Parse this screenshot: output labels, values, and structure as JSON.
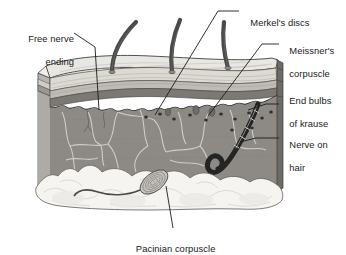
{
  "figure": {
    "type": "anatomical-cross-section-diagram",
    "style": "grayscale line illustration of a three-dimensional block of skin"
  },
  "labels": [
    {
      "id": "free-nerve-ending",
      "text_line1": "Free nerve",
      "text_line2": "ending",
      "align": "right",
      "x": 8,
      "y": 22
    },
    {
      "id": "merkels-discs",
      "text_line1": "Merkel's discs",
      "text_line2": "",
      "align": "left",
      "x": 242,
      "y": 6
    },
    {
      "id": "meissners-corpuscle",
      "text_line1": "Meissner's",
      "text_line2": "corpuscle",
      "align": "left",
      "x": 282,
      "y": 34
    },
    {
      "id": "end-bulbs-of-krause",
      "text_line1": "End bulbs",
      "text_line2": "of krause",
      "align": "left",
      "x": 282,
      "y": 84
    },
    {
      "id": "nerve-on-hair",
      "text_line1": "Nerve on",
      "text_line2": "hair",
      "align": "left",
      "x": 282,
      "y": 128
    },
    {
      "id": "pacinian-corpuscle",
      "text_line1": "Pacinian corpuscle",
      "text_line2": "",
      "align": "center",
      "x": 110,
      "y": 232
    }
  ],
  "structures": [
    {
      "id": "hair-shaft",
      "name": "hair shaft",
      "count": 3
    },
    {
      "id": "epidermis",
      "name": "epidermis"
    },
    {
      "id": "stratum-corneum",
      "name": "stratum corneum"
    },
    {
      "id": "dermal-junction",
      "name": "dermal-epidermal junction"
    },
    {
      "id": "dermis",
      "name": "dermis"
    },
    {
      "id": "capillary-network",
      "name": "capillary network"
    },
    {
      "id": "krause-bulb-dot",
      "name": "end bulb of Krause",
      "count": 11
    },
    {
      "id": "hair-follicle-nerve",
      "name": "nerve wrapped around hair follicle"
    },
    {
      "id": "pacinian-corpuscle-body",
      "name": "Pacinian corpuscle"
    },
    {
      "id": "subcutaneous-fat",
      "name": "subcutaneous fat layer"
    },
    {
      "id": "nerve-fiber",
      "name": "nerve fiber to Pacinian corpuscle"
    }
  ],
  "colors": {
    "background": "#ffffff",
    "text": "#1b1b1b",
    "leader_line": "#1b1b1b",
    "top_surface": "#e8e6e1",
    "epidermis_light": "#dedbd5",
    "epidermis_mid": "#bcb9b3",
    "epidermis_dark": "#8e8b86",
    "dermis": "#8d8a85",
    "dermis_side": "#a6a3a0",
    "fat": "#f4f3f0",
    "hair": "#4b4b4b",
    "outline": "#3a3a3a"
  }
}
